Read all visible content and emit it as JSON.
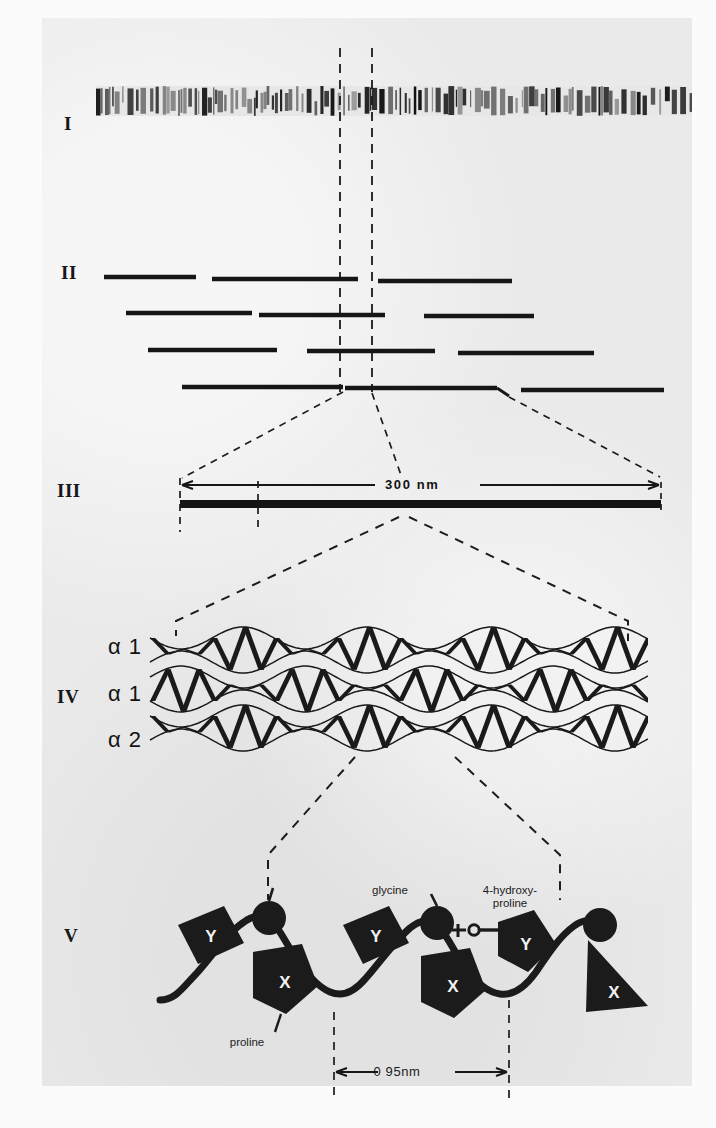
{
  "figure": {
    "panels": [
      {
        "id": "I",
        "numeral": "I",
        "caption_name": "collagen-fibril-striation-micrograph"
      },
      {
        "id": "II",
        "numeral": "II",
        "caption_name": "staggered-molecule-packing"
      },
      {
        "id": "III",
        "numeral": "III",
        "caption_name": "single-collagen-molecule"
      },
      {
        "id": "IV",
        "numeral": "IV",
        "caption_name": "triple-helix"
      },
      {
        "id": "V",
        "numeral": "V",
        "caption_name": "polypeptide-chain-detail"
      }
    ]
  },
  "panel3": {
    "scale_label": "300 nm"
  },
  "panel4": {
    "chain_labels": [
      "α 1",
      "α 1",
      "α 2"
    ]
  },
  "panel5": {
    "glycine_label": "glycine",
    "hydroxyproline_label": "4-hydroxy-\nproline",
    "hydroxyl_label": "HO",
    "proline_label": "proline",
    "spacing_label": "0 95nm",
    "residue_x": "X",
    "residue_y": "Y"
  },
  "colors": {
    "ink": "#141414",
    "page": "#eaeaea",
    "margin": "#fbfbfb"
  }
}
